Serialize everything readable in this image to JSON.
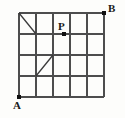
{
  "figure": {
    "type": "lattice-grid-diagram",
    "width": 125,
    "height": 118,
    "background_color": "#fdfdfb",
    "line_color": "#4d4d4d",
    "heavy_line_color": "#3a3a3a",
    "point_color": "#111111",
    "label_color": "#1a1a1a"
  },
  "grid": {
    "columns": 5,
    "rows": 4,
    "origin_x": 19,
    "origin_y": 13,
    "cell_width": 17,
    "cell_height": 21,
    "right_x": 104,
    "bottom_y": 97
  },
  "labels": {
    "a": "A",
    "b": "B",
    "p": "P"
  },
  "points": [
    {
      "name": "A",
      "label": "A",
      "col": 0,
      "row": 4,
      "x": 19,
      "y": 97
    },
    {
      "name": "B",
      "label": "B",
      "col": 5,
      "row": 0,
      "x": 104,
      "y": 13
    },
    {
      "name": "P",
      "label": "P",
      "col": 2,
      "row": 1,
      "x": 64,
      "y": 34
    }
  ],
  "diagonals": [
    {
      "name": "upper-left-diagonal",
      "from_col": 0,
      "from_row": 0,
      "to_col": 1,
      "to_row": 1,
      "x1": 19,
      "y1": 13,
      "x2": 36,
      "y2": 34
    },
    {
      "name": "lower-left-diagonal",
      "from_col": 1,
      "from_row": 3,
      "to_col": 2,
      "to_row": 2,
      "x1": 36,
      "y1": 76,
      "x2": 53,
      "y2": 55
    }
  ]
}
